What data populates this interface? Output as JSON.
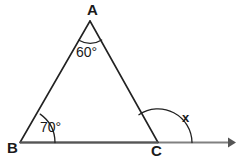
{
  "figure": {
    "type": "geometry-diagram",
    "canvas": {
      "width": 239,
      "height": 165,
      "background": "#ffffff"
    },
    "colors": {
      "triangle_stroke": "#222222",
      "baseline_stroke": "#808080",
      "arc_stroke": "#222222",
      "text": "#1a1a1a"
    },
    "vertices": [
      {
        "name": "A",
        "label": "A",
        "x": 90,
        "y": 21
      },
      {
        "name": "B",
        "label": "B",
        "x": 20,
        "y": 143
      },
      {
        "name": "C",
        "label": "C",
        "x": 158,
        "y": 142
      }
    ],
    "ray": {
      "from": "C",
      "to_x": 234,
      "to_y": 142,
      "arrowhead": true
    },
    "angles": [
      {
        "at": "A",
        "label": "60°",
        "value": 60,
        "unit": "degrees",
        "kind": "interior"
      },
      {
        "at": "B",
        "label": "70°",
        "value": 70,
        "unit": "degrees",
        "kind": "interior"
      },
      {
        "at": "C",
        "label": "x",
        "value": null,
        "unit": "degrees",
        "kind": "exterior"
      }
    ],
    "labels": {
      "vertex_a": "A",
      "vertex_b": "B",
      "vertex_c": "C",
      "angle_a": "60°",
      "angle_b": "70°",
      "angle_x": "x"
    }
  }
}
